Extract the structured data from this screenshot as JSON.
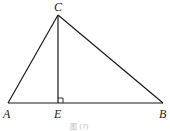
{
  "figure": {
    "points": {
      "A": {
        "label": "A",
        "x": 8,
        "y": 103
      },
      "B": {
        "label": "B",
        "x": 163,
        "y": 103
      },
      "C": {
        "label": "C",
        "x": 58,
        "y": 15
      },
      "E": {
        "label": "E",
        "x": 58,
        "y": 103
      }
    },
    "segments": [
      "AC",
      "CB",
      "AB",
      "CE"
    ],
    "right_angle_at": "E",
    "caption": "图 (?)"
  },
  "colors": {
    "line": "#1a1a1a",
    "label": "#222222",
    "caption": "#bbbbbb"
  }
}
